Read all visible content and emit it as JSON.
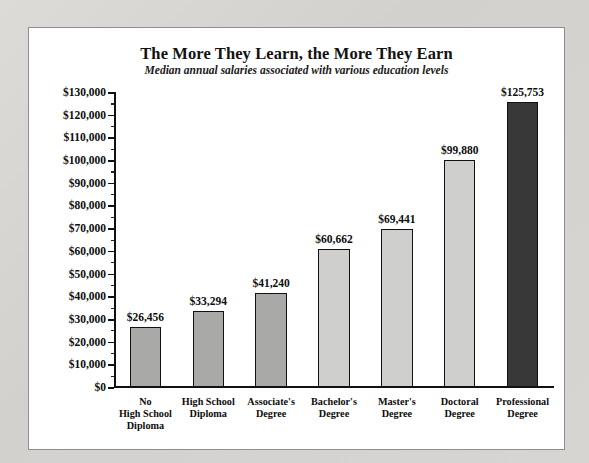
{
  "chart_data": {
    "type": "bar",
    "title": "The More They Learn, the More They Earn",
    "subtitle": "Median annual salaries associated with various education levels",
    "xlabel": "",
    "ylabel": "",
    "ylim": [
      0,
      130000
    ],
    "ytick_step": 10000,
    "yminor_step": 5000,
    "grid": false,
    "legend": false,
    "categories": [
      "No\nHigh School\nDiploma",
      "High School\nDiploma",
      "Associate's\nDegree",
      "Bachelor's\nDegree",
      "Master's\nDegree",
      "Doctoral\nDegree",
      "Professional\nDegree"
    ],
    "values": [
      26456,
      33294,
      41240,
      60662,
      69441,
      99880,
      125753
    ],
    "value_labels": [
      "$26,456",
      "$33,294",
      "$41,240",
      "$60,662",
      "$69,441",
      "$99,880",
      "$125,753"
    ],
    "bar_colors": [
      "#a9a9a7",
      "#a9a9a7",
      "#a9a9a7",
      "#cfcfcd",
      "#cfcfcd",
      "#cfcfcd",
      "#383838"
    ],
    "ytick_labels": [
      "$0",
      "$10,000",
      "$20,000",
      "$30,000",
      "$40,000",
      "$50,000",
      "$60,000",
      "$70,000",
      "$80,000",
      "$90,000",
      "$100,000",
      "$110,000",
      "$120,000",
      "$130,000"
    ],
    "ytick_values": [
      0,
      10000,
      20000,
      30000,
      40000,
      50000,
      60000,
      70000,
      80000,
      90000,
      100000,
      110000,
      120000,
      130000
    ]
  },
  "style": {
    "page_background": "#d5d4d1",
    "panel_background": "#ffffff",
    "panel_border": "#8f8f8f",
    "axis_color": "#111111",
    "text_color": "#0d0d0d"
  }
}
